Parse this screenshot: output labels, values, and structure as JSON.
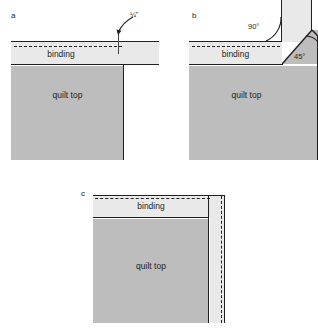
{
  "figure": {
    "background": "#ffffff",
    "binding_color": "#e9e9e9",
    "quilt_color": "#bdbdbd",
    "line_color": "#231f20"
  },
  "panels": [
    {
      "id": "a",
      "label": "a",
      "binding_label": "binding",
      "quilt_label": "quilt top",
      "dimension": "1/4\"",
      "dimension_display": "¼\""
    },
    {
      "id": "b",
      "label": "b",
      "binding_label": "binding",
      "quilt_label": "quilt top",
      "angle_corner": "90°",
      "angle_fold": "45°"
    },
    {
      "id": "c",
      "label": "c",
      "binding_label": "binding",
      "quilt_label": "quilt top"
    }
  ]
}
